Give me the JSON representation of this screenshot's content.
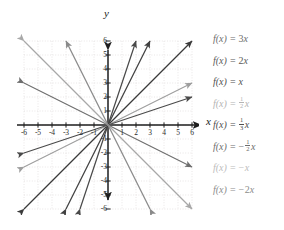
{
  "figure": {
    "kind": "coordinate-plane-line-graph",
    "axis_labels": {
      "x": "x",
      "y": "y"
    }
  },
  "chart_data": {
    "type": "line",
    "title": "",
    "xlabel": "x",
    "ylabel": "y",
    "xlim": [
      -6,
      6
    ],
    "ylim": [
      -6,
      6
    ],
    "xticks": [
      -6,
      -5,
      -4,
      -3,
      -2,
      -1,
      1,
      2,
      3,
      4,
      5,
      6
    ],
    "yticks": [
      -6,
      -5,
      -4,
      -3,
      -2,
      -1,
      1,
      2,
      3,
      4,
      5,
      6
    ],
    "xtick_labels": [
      "-6",
      "-5",
      "-4",
      "-3",
      "-2",
      "-1",
      "1",
      "2",
      "3",
      "4",
      "5",
      "6"
    ],
    "ytick_labels": [
      "-6",
      "-5",
      "-4",
      "-3",
      "-2",
      "-1",
      "1",
      "2",
      "3",
      "4",
      "5",
      "6"
    ],
    "grid": true,
    "legend_position": "right",
    "series": [
      {
        "name": "f(x) = 3x",
        "slope": 3,
        "intercept": 0,
        "color": "#4a4a4a"
      },
      {
        "name": "f(x) = 2x",
        "slope": 2,
        "intercept": 0,
        "color": "#404040"
      },
      {
        "name": "f(x) = x",
        "slope": 1,
        "intercept": 0,
        "color": "#3a3a3a"
      },
      {
        "name": "f(x) = 1/2 x",
        "slope": 0.5,
        "intercept": 0,
        "color": "#9e9e9e"
      },
      {
        "name": "f(x) = 1/3 x",
        "slope": 0.3333333333,
        "intercept": 0,
        "color": "#4a4a4a"
      },
      {
        "name": "f(x) = -1/2 x",
        "slope": -0.5,
        "intercept": 0,
        "color": "#6e6e6e"
      },
      {
        "name": "f(x) = -x",
        "slope": -1,
        "intercept": 0,
        "color": "#a8a8a8"
      },
      {
        "name": "f(x) = -2x",
        "slope": -2,
        "intercept": 0,
        "color": "#8a8a8a"
      }
    ]
  },
  "ticks": {
    "x": [
      {
        "label": "-6",
        "value": -6
      },
      {
        "label": "-5",
        "value": -5
      },
      {
        "label": "-4",
        "value": -4
      },
      {
        "label": "-3",
        "value": -3
      },
      {
        "label": "-2",
        "value": -2
      },
      {
        "label": "-1",
        "value": -1
      },
      {
        "label": "1",
        "value": 1
      },
      {
        "label": "2",
        "value": 2
      },
      {
        "label": "3",
        "value": 3
      },
      {
        "label": "4",
        "value": 4
      },
      {
        "label": "5",
        "value": 5
      },
      {
        "label": "6",
        "value": 6
      }
    ],
    "y": [
      {
        "label": "6",
        "value": 6
      },
      {
        "label": "5",
        "value": 5
      },
      {
        "label": "4",
        "value": 4
      },
      {
        "label": "3",
        "value": 3
      },
      {
        "label": "2",
        "value": 2
      },
      {
        "label": "1",
        "value": 1
      },
      {
        "label": "-1",
        "value": -1
      },
      {
        "label": "-2",
        "value": -2
      },
      {
        "label": "-3",
        "value": -3
      },
      {
        "label": "-4",
        "value": -4
      },
      {
        "label": "-5",
        "value": -5
      },
      {
        "label": "-6",
        "value": -6
      }
    ]
  },
  "legend": {
    "items": [
      {
        "fn": "f(x)",
        "eq": "=",
        "coefficient": "3",
        "variable": "x",
        "negative": false,
        "fraction": null,
        "color": "#6d6d6d"
      },
      {
        "fn": "f(x)",
        "eq": "=",
        "coefficient": "2",
        "variable": "x",
        "negative": false,
        "fraction": null,
        "color": "#5a5a5a"
      },
      {
        "fn": "f(x)",
        "eq": "=",
        "coefficient": "",
        "variable": "x",
        "negative": false,
        "fraction": null,
        "color": "#4f4f4f"
      },
      {
        "fn": "f(x)",
        "eq": "=",
        "coefficient": "",
        "variable": "x",
        "negative": false,
        "fraction": {
          "num": "1",
          "den": "2"
        },
        "color": "#b4b4b4"
      },
      {
        "fn": "f(x)",
        "eq": "=",
        "coefficient": "",
        "variable": "x",
        "negative": false,
        "fraction": {
          "num": "1",
          "den": "3"
        },
        "color": "#4f4f4f"
      },
      {
        "fn": "f(x)",
        "eq": "=",
        "coefficient": "",
        "variable": "x",
        "negative": true,
        "fraction": {
          "num": "1",
          "den": "2"
        },
        "color": "#6d6d6d"
      },
      {
        "fn": "f(x)",
        "eq": "=",
        "coefficient": "",
        "variable": "x",
        "negative": true,
        "fraction": null,
        "color": "#bcbcbc"
      },
      {
        "fn": "f(x)",
        "eq": "=",
        "coefficient": "2",
        "variable": "x",
        "negative": true,
        "fraction": null,
        "color": "#8c8c8c"
      }
    ]
  },
  "style": {
    "background": "#ffffff",
    "axis_color": "#1e1e1e",
    "grid_color": "#e3e0e0",
    "tick_text_color": "#2b2b2b"
  }
}
